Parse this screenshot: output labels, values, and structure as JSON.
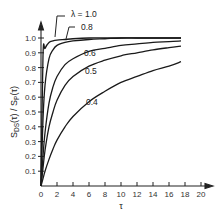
{
  "chart_data": {
    "type": "line",
    "title": "",
    "xlabel": "τ",
    "ylabel": "S_DS(τ) / S_P(τ)",
    "xlim": [
      0,
      20
    ],
    "ylim": [
      0,
      1.05
    ],
    "x_ticks": [
      "0",
      "2",
      "4",
      "6",
      "8",
      "10",
      "12",
      "14",
      "16",
      "18",
      "20"
    ],
    "y_ticks": [
      "0.1",
      "0.2",
      "0.3",
      "0.4",
      "0.5",
      "0.6",
      "0.7",
      "0.8",
      "0.9",
      "1.0"
    ],
    "grid": false,
    "legend": "inline curve labels",
    "x": [
      0,
      0.25,
      0.5,
      1,
      1.5,
      2,
      3,
      4,
      6,
      8,
      10,
      12,
      14,
      16,
      17.5
    ],
    "series": [
      {
        "name": "λ = 1.0",
        "label": "λ = 1.0",
        "values": [
          0,
          0.88,
          0.93,
          0.97,
          0.98,
          0.985,
          0.99,
          0.995,
          1.0,
          1.0,
          1.0,
          1.0,
          1.0,
          1.0,
          1.0
        ]
      },
      {
        "name": "0.8",
        "label": "0.8",
        "values": [
          0,
          0.45,
          0.68,
          0.86,
          0.92,
          0.95,
          0.97,
          0.98,
          0.99,
          0.995,
          1.0,
          1.0,
          1.0,
          1.0,
          1.0
        ]
      },
      {
        "name": "0.6",
        "label": "0.6",
        "values": [
          0,
          0.2,
          0.36,
          0.56,
          0.67,
          0.74,
          0.82,
          0.86,
          0.91,
          0.93,
          0.95,
          0.96,
          0.97,
          0.975,
          0.98
        ]
      },
      {
        "name": "0.5",
        "label": "0.5",
        "values": [
          0,
          0.12,
          0.24,
          0.4,
          0.5,
          0.58,
          0.68,
          0.74,
          0.81,
          0.85,
          0.88,
          0.9,
          0.92,
          0.935,
          0.945
        ]
      },
      {
        "name": "0.4",
        "label": "0.4",
        "values": [
          0,
          0.05,
          0.1,
          0.18,
          0.25,
          0.31,
          0.4,
          0.47,
          0.57,
          0.64,
          0.7,
          0.74,
          0.78,
          0.81,
          0.84
        ]
      }
    ]
  },
  "labels": {
    "y_axis": "S_DS(τ) / S_P(τ)",
    "y_main_1": "S",
    "y_sub_1": "DS",
    "y_mid": "(τ) / S",
    "y_sub_2": "P",
    "y_end": "(τ)",
    "x_axis": "τ"
  }
}
